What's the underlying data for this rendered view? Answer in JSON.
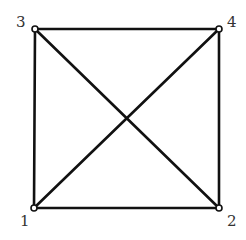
{
  "diagram": {
    "type": "graph",
    "title": "",
    "colors": {
      "edge": "#111111",
      "vertex_fill": "#ffffff",
      "vertex_stroke": "#111111",
      "label": "#333333",
      "background": "#ffffff"
    },
    "vertices": [
      {
        "id": "1",
        "label": "1",
        "x": 34,
        "y": 208,
        "label_x": 20,
        "label_y": 226
      },
      {
        "id": "2",
        "label": "2",
        "x": 219,
        "y": 208,
        "label_x": 227,
        "label_y": 226
      },
      {
        "id": "3",
        "label": "3",
        "x": 35,
        "y": 29,
        "label_x": 16,
        "label_y": 27
      },
      {
        "id": "4",
        "label": "4",
        "x": 219,
        "y": 29,
        "label_x": 227,
        "label_y": 27
      }
    ],
    "edges": [
      {
        "from": "1",
        "to": "2"
      },
      {
        "from": "2",
        "to": "4"
      },
      {
        "from": "4",
        "to": "3"
      },
      {
        "from": "3",
        "to": "1"
      },
      {
        "from": "1",
        "to": "4"
      },
      {
        "from": "3",
        "to": "2"
      }
    ]
  }
}
